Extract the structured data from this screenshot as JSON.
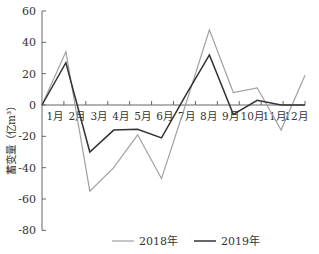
{
  "chart_data": {
    "type": "line",
    "title": "",
    "xlabel": "",
    "ylabel": "蓄变量（亿m³）",
    "ylim": [
      -80,
      60
    ],
    "yticks": [
      60,
      40,
      20,
      0,
      -20,
      -40,
      -60,
      -80
    ],
    "x_tick_labels": [
      "1月",
      "2月",
      "3月",
      "4月",
      "5月",
      "6月",
      "7月",
      "8月",
      "9月",
      "10月",
      "11月",
      "12月"
    ],
    "x": [
      0,
      1,
      2,
      3,
      4,
      5,
      6,
      7,
      8,
      9,
      10,
      11
    ],
    "series": [
      {
        "name": "2018年",
        "color": "#a0a0a0",
        "values": [
          0,
          34,
          -55,
          -40,
          -19,
          -47,
          0,
          48,
          8,
          11,
          -16,
          19
        ]
      },
      {
        "name": "2019年",
        "color": "#333333",
        "values": [
          0,
          27,
          -30,
          -16,
          -15.5,
          -21,
          6,
          32,
          -6,
          3,
          0,
          0
        ]
      }
    ],
    "grid": false,
    "legend_position": "bottom"
  },
  "legend": {
    "items": [
      {
        "label": "2018年",
        "color": "#a0a0a0"
      },
      {
        "label": "2019年",
        "color": "#333333"
      }
    ]
  }
}
